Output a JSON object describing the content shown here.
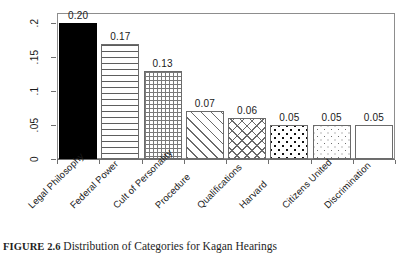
{
  "chart_data": {
    "type": "bar",
    "title": "",
    "xlabel": "",
    "ylabel": "",
    "ylim": [
      0,
      0.215
    ],
    "grid": false,
    "legend": "none",
    "ytick_labels": [
      "0",
      ".05",
      ".1",
      ".15",
      ".2"
    ],
    "ytick_values": [
      0,
      0.05,
      0.1,
      0.15,
      0.2
    ],
    "categories": [
      "Legal Philosophy",
      "Federal Power",
      "Cult of Personality",
      "Procedure",
      "Qualifications",
      "Harvard",
      "Citizens United",
      "Discrimination"
    ],
    "values": [
      0.2,
      0.17,
      0.13,
      0.07,
      0.06,
      0.05,
      0.05,
      0.05
    ],
    "value_labels": [
      "0.20",
      "0.17",
      "0.13",
      "0.07",
      "0.06",
      "0.05",
      "0.05",
      "0.05"
    ],
    "bar_fills": [
      "solid-black",
      "horizontal-lines",
      "fine-grid",
      "diagonal-stripes",
      "diagonal-crosshatch",
      "large-dots",
      "small-dots",
      "empty-white"
    ]
  },
  "caption": {
    "label": "FIGURE 2.6",
    "text": "Distribution of Categories for Kagan Hearings"
  },
  "colors": {
    "axis": "#6f6f6f",
    "frame": "#8d8d8d",
    "text": "#1a1a1a",
    "bar_outline": "#6b6b6b",
    "solid_fill": "#000000",
    "background": "#ffffff"
  }
}
